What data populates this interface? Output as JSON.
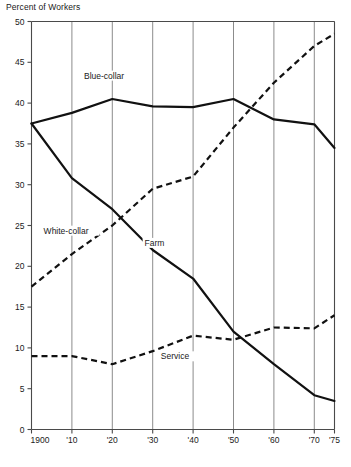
{
  "chart_data": {
    "type": "line",
    "title": "Percent of Workers",
    "xlabel": "",
    "ylabel": "Percent of Workers",
    "x": [
      1900,
      1910,
      1920,
      1930,
      1940,
      1950,
      1960,
      1970,
      1975
    ],
    "xtick_labels": [
      "1900",
      "'10",
      "'20",
      "'30",
      "'40",
      "'50",
      "'60",
      "'70",
      "'75"
    ],
    "ytick_labels": [
      "0",
      "5",
      "10",
      "15",
      "20",
      "25",
      "30",
      "35",
      "40",
      "45",
      "50"
    ],
    "ytick_values": [
      0,
      5,
      10,
      15,
      20,
      25,
      30,
      35,
      40,
      45,
      50
    ],
    "xlim": [
      1900,
      1975
    ],
    "ylim": [
      0,
      50
    ],
    "grid": "vertical",
    "legend_position": "inline-annotations",
    "series": [
      {
        "name": "Blue-collar",
        "style": "solid",
        "label_x": 1913,
        "label_y": 43.0,
        "values": [
          37.5,
          38.8,
          40.5,
          39.6,
          39.5,
          40.5,
          38.0,
          37.4,
          34.5
        ]
      },
      {
        "name": "White-collar",
        "style": "dashed",
        "label_x": 1903,
        "label_y": 24.0,
        "values": [
          17.5,
          21.5,
          25.0,
          29.5,
          31.0,
          37.0,
          42.5,
          47.0,
          48.5
        ]
      },
      {
        "name": "Farm",
        "style": "solid",
        "label_x": 1928,
        "label_y": 22.5,
        "values": [
          37.5,
          30.8,
          27.0,
          22.0,
          18.5,
          12.0,
          8.0,
          4.2,
          3.5
        ]
      },
      {
        "name": "Service",
        "style": "dashed",
        "label_x": 1932,
        "label_y": 8.6,
        "values": [
          9.0,
          9.0,
          8.0,
          9.6,
          11.5,
          11.0,
          12.5,
          12.4,
          14.0
        ]
      }
    ]
  }
}
